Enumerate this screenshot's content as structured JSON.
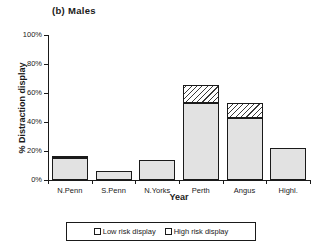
{
  "chart_data": {
    "type": "bar",
    "title": "(b) Males",
    "xlabel": "Year",
    "ylabel": "% Distraction display",
    "categories": [
      "N.Penn",
      "S.Penn",
      "N.Yorks",
      "Perth",
      "Angus",
      "Highl."
    ],
    "ylim": [
      0,
      100
    ],
    "yticks": [
      0,
      20,
      40,
      60,
      80,
      100
    ],
    "ytick_labels": [
      "0%",
      "20%",
      "40%",
      "60%",
      "80%",
      "100%"
    ],
    "grid": false,
    "stacked": true,
    "legend_position": "bottom",
    "series": [
      {
        "name": "Low risk display",
        "values": [
          15.5,
          6.2,
          13.8,
          52.8,
          42.8,
          22.3
        ]
      },
      {
        "name": "High risk display",
        "values": [
          1.2,
          0.0,
          0.0,
          12.4,
          10.4,
          0.0
        ]
      }
    ],
    "totals": [
      16.7,
      6.2,
      13.8,
      65.2,
      53.2,
      22.3
    ]
  },
  "legend": {
    "entries": [
      {
        "label": "Low risk display",
        "swatch": "low-risk-swatch"
      },
      {
        "label": "High risk display",
        "swatch": "high-risk-swatch"
      }
    ]
  },
  "colors": {
    "axis": "#1a1a1a",
    "low_risk_fill": "#e2e2e2",
    "high_risk_fill": "#ffffff",
    "hatch": "#3a3a3a",
    "background": "#ffffff"
  }
}
